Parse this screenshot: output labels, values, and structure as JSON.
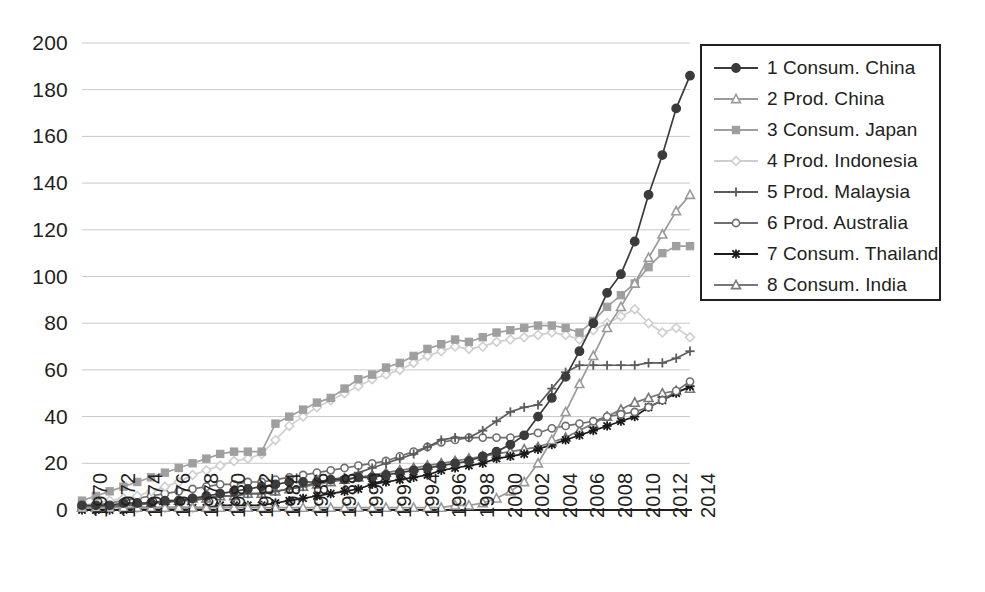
{
  "chart_data": {
    "type": "line",
    "title": "",
    "xlabel": "",
    "ylabel": "",
    "ylim": [
      0,
      200
    ],
    "ytick_step": 20,
    "yticks": [
      "0",
      "20",
      "40",
      "60",
      "80",
      "100",
      "120",
      "140",
      "160",
      "180",
      "200"
    ],
    "xlim": [
      1970,
      2014
    ],
    "xtick_step": 2,
    "xticks": [
      "1970",
      "1972",
      "1974",
      "1976",
      "1978",
      "1980",
      "1982",
      "1984",
      "1986",
      "1988",
      "1990",
      "1992",
      "1994",
      "1996",
      "1998",
      "2000",
      "2002",
      "2004",
      "2006",
      "2008",
      "2010",
      "2012",
      "2014"
    ],
    "x": [
      1970,
      1971,
      1972,
      1973,
      1974,
      1975,
      1976,
      1977,
      1978,
      1979,
      1980,
      1981,
      1982,
      1983,
      1984,
      1985,
      1986,
      1987,
      1988,
      1989,
      1990,
      1991,
      1992,
      1993,
      1994,
      1995,
      1996,
      1997,
      1998,
      1999,
      2000,
      2001,
      2002,
      2003,
      2004,
      2005,
      2006,
      2007,
      2008,
      2009,
      2010,
      2011,
      2012,
      2013,
      2014
    ],
    "grid": "horizontal",
    "legend_position": "right",
    "series": [
      {
        "name": "1 Consum. China",
        "label": "1 Consum. China",
        "number": 1,
        "marker": "circle-filled",
        "color": "#3b3b3b",
        "values": [
          2,
          2,
          2,
          3,
          3,
          3,
          4,
          4,
          5,
          6,
          7,
          8,
          9,
          10,
          11,
          12,
          12,
          12,
          13,
          13,
          14,
          14,
          15,
          16,
          17,
          18,
          19,
          20,
          21,
          23,
          25,
          28,
          32,
          40,
          48,
          57,
          68,
          80,
          93,
          101,
          115,
          135,
          152,
          172,
          186
        ]
      },
      {
        "name": "2 Prod. China",
        "label": "2 Prod. China",
        "number": 2,
        "marker": "triangle",
        "color": "#9a9a9a",
        "values": [
          1,
          1,
          1,
          1,
          1,
          1,
          1,
          1,
          1,
          1,
          1,
          1,
          1,
          1,
          1,
          1,
          1,
          1,
          1,
          1,
          1,
          1,
          1,
          1,
          1,
          1,
          1,
          2,
          2,
          3,
          5,
          8,
          12,
          20,
          30,
          42,
          54,
          66,
          78,
          87,
          97,
          108,
          118,
          128,
          135
        ]
      },
      {
        "name": "3 Consum. Japan",
        "label": "3 Consum. Japan",
        "number": 3,
        "marker": "square",
        "color": "#9f9f9f",
        "values": [
          4,
          6,
          8,
          10,
          12,
          14,
          16,
          18,
          20,
          22,
          24,
          25,
          25,
          25,
          37,
          40,
          43,
          46,
          48,
          52,
          56,
          58,
          61,
          63,
          66,
          69,
          71,
          73,
          72,
          74,
          76,
          77,
          78,
          79,
          79,
          78,
          76,
          81,
          87,
          92,
          97,
          104,
          110,
          113,
          113
        ]
      },
      {
        "name": "4 Prod. Indonesia",
        "label": "4 Prod. Indonesia",
        "number": 4,
        "marker": "diamond",
        "color": "#cfcfcf",
        "values": [
          2,
          3,
          4,
          5,
          6,
          8,
          10,
          12,
          15,
          17,
          19,
          21,
          22,
          24,
          30,
          36,
          40,
          44,
          47,
          50,
          53,
          56,
          58,
          60,
          63,
          66,
          68,
          70,
          69,
          70,
          72,
          73,
          74,
          75,
          76,
          75,
          73,
          77,
          80,
          83,
          86,
          80,
          76,
          78,
          74
        ]
      },
      {
        "name": "5 Prod. Malaysia",
        "label": "5 Prod. Malaysia",
        "number": 5,
        "marker": "plus",
        "color": "#5c5c5c",
        "values": [
          1,
          1,
          1,
          2,
          2,
          3,
          3,
          4,
          4,
          5,
          6,
          6,
          7,
          7,
          8,
          9,
          10,
          12,
          13,
          14,
          16,
          18,
          20,
          22,
          24,
          27,
          30,
          31,
          31,
          34,
          38,
          42,
          44,
          45,
          52,
          59,
          62,
          62,
          62,
          62,
          62,
          63,
          63,
          65,
          68
        ]
      },
      {
        "name": "6 Prod. Australia",
        "label": "6 Prod. Australia",
        "number": 6,
        "marker": "circle-open",
        "color": "#6f6f6f",
        "values": [
          1,
          2,
          3,
          4,
          5,
          6,
          7,
          8,
          9,
          10,
          11,
          11,
          12,
          12,
          13,
          14,
          15,
          16,
          17,
          18,
          19,
          20,
          21,
          23,
          25,
          27,
          29,
          30,
          31,
          31,
          31,
          31,
          32,
          33,
          35,
          36,
          37,
          38,
          40,
          41,
          42,
          44,
          47,
          51,
          55
        ]
      },
      {
        "name": "7 Consum. Thailand",
        "label": "7 Consum. Thailand",
        "number": 7,
        "marker": "star",
        "color": "#1a1a1a",
        "values": [
          0,
          0,
          0,
          0,
          1,
          1,
          1,
          1,
          1,
          1,
          2,
          2,
          2,
          2,
          3,
          4,
          5,
          6,
          7,
          8,
          9,
          11,
          12,
          13,
          14,
          15,
          17,
          18,
          19,
          20,
          22,
          23,
          24,
          26,
          28,
          30,
          32,
          34,
          36,
          38,
          40,
          44,
          47,
          50,
          53
        ]
      },
      {
        "name": "8 Consum. India",
        "label": "8 Consum. India",
        "number": 8,
        "marker": "triangle-open",
        "color": "#787878",
        "values": [
          1,
          1,
          2,
          2,
          3,
          3,
          4,
          4,
          5,
          5,
          6,
          6,
          7,
          7,
          8,
          9,
          10,
          11,
          12,
          13,
          14,
          15,
          16,
          17,
          18,
          19,
          20,
          21,
          22,
          23,
          24,
          25,
          26,
          27,
          29,
          31,
          34,
          37,
          40,
          43,
          46,
          48,
          50,
          51,
          52
        ]
      }
    ]
  }
}
